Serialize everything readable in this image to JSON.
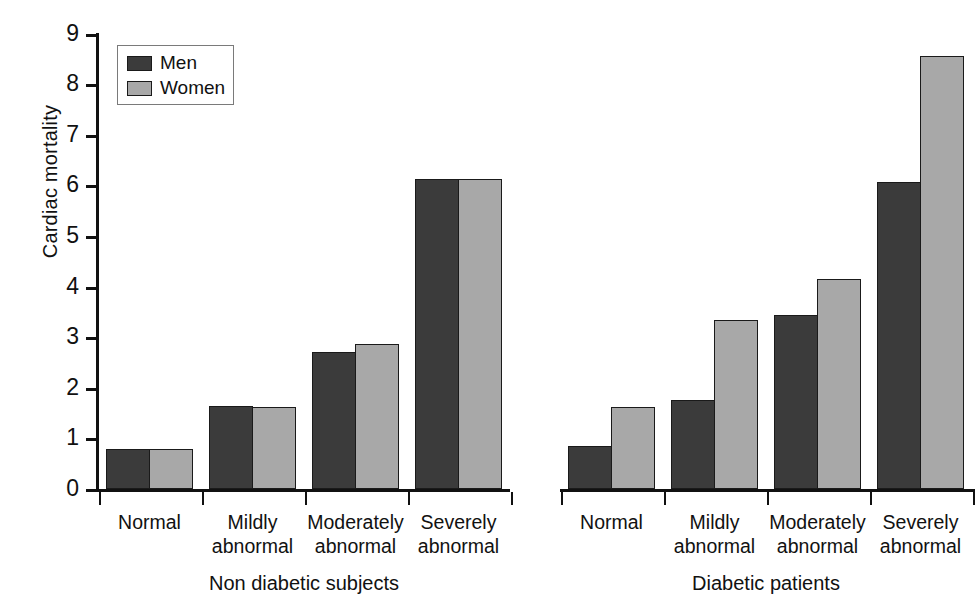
{
  "chart_data": {
    "type": "bar",
    "title": "",
    "xlabel": "",
    "ylabel": "Cardiac mortality",
    "ylim": [
      0,
      9
    ],
    "ytick_labels": [
      "0",
      "1",
      "2",
      "3",
      "4",
      "5",
      "6",
      "7",
      "8",
      "9"
    ],
    "yticks": [
      0,
      1,
      2,
      3,
      4,
      5,
      6,
      7,
      8,
      9
    ],
    "grid": false,
    "legend": {
      "position": "top-left",
      "entries": [
        {
          "name": "Men",
          "color": "#3b3b3b"
        },
        {
          "name": "Women",
          "color": "#a8a8a8"
        }
      ]
    },
    "categories": [
      "Normal",
      "Mildly abnormal",
      "Moderately abnormal",
      "Severely abnormal"
    ],
    "groups": [
      {
        "name": "Non diabetic subjects",
        "series": [
          {
            "name": "Men",
            "values": [
              0.8,
              1.65,
              2.7,
              6.12
            ]
          },
          {
            "name": "Women",
            "values": [
              0.8,
              1.62,
              2.86,
              6.13
            ]
          }
        ]
      },
      {
        "name": "Diabetic patients",
        "series": [
          {
            "name": "Men",
            "values": [
              0.85,
              1.75,
              3.43,
              6.06
            ]
          },
          {
            "name": "Women",
            "values": [
              1.62,
              3.34,
              4.15,
              8.55
            ]
          }
        ]
      }
    ]
  },
  "axes": {
    "y_label": "Cardiac mortality",
    "y_ticks": [
      "9",
      "8",
      "7",
      "6",
      "5",
      "4",
      "3",
      "2",
      "1",
      "0"
    ]
  },
  "legend": {
    "men_label": "Men",
    "women_label": "Women"
  },
  "groups": {
    "left": {
      "label": "Non diabetic subjects",
      "categories": [
        {
          "line1": "Normal",
          "line2": ""
        },
        {
          "line1": "Mildly",
          "line2": "abnormal"
        },
        {
          "line1": "Moderately",
          "line2": "abnormal"
        },
        {
          "line1": "Severely",
          "line2": "abnormal"
        }
      ]
    },
    "right": {
      "label": "Diabetic patients",
      "categories": [
        {
          "line1": "Normal",
          "line2": ""
        },
        {
          "line1": "Mildly",
          "line2": "abnormal"
        },
        {
          "line1": "Moderately",
          "line2": "abnormal"
        },
        {
          "line1": "Severely",
          "line2": "abnormal"
        }
      ]
    }
  },
  "colors": {
    "men": "#3b3b3b",
    "women": "#a8a8a8",
    "axis": "#111111"
  }
}
